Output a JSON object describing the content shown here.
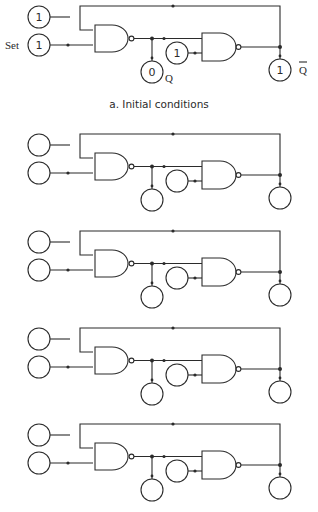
{
  "diagram": {
    "type": "nand-latch-sequence",
    "title_caption": "a. Initial conditions",
    "panels": [
      {
        "id": "a",
        "caption": "a. Initial conditions",
        "inputs": {
          "top_input": "1",
          "set_input": "1",
          "feedback_input": "1"
        },
        "outputs": {
          "q": "0",
          "q_bar": "1"
        },
        "labels": {
          "set": "Set",
          "q": "Q",
          "q_bar": "Q"
        }
      },
      {
        "id": "b",
        "inputs": {
          "top_input": "",
          "set_input": "",
          "feedback_input": ""
        },
        "outputs": {
          "q": "",
          "q_bar": ""
        }
      },
      {
        "id": "c",
        "inputs": {
          "top_input": "",
          "set_input": "",
          "feedback_input": ""
        },
        "outputs": {
          "q": "",
          "q_bar": ""
        }
      },
      {
        "id": "d",
        "inputs": {
          "top_input": "",
          "set_input": "",
          "feedback_input": ""
        },
        "outputs": {
          "q": "",
          "q_bar": ""
        }
      },
      {
        "id": "e",
        "inputs": {
          "top_input": "",
          "set_input": "",
          "feedback_input": ""
        },
        "outputs": {
          "q": "",
          "q_bar": ""
        }
      }
    ],
    "components": {
      "gates": [
        "NAND gate 1",
        "NAND gate 2"
      ],
      "circle_nodes": [
        "top-input",
        "set-input",
        "feedback-input",
        "q-output",
        "q-bar-output"
      ]
    },
    "colors": {
      "line": "#2b2b2b",
      "background": "#ffffff"
    }
  }
}
